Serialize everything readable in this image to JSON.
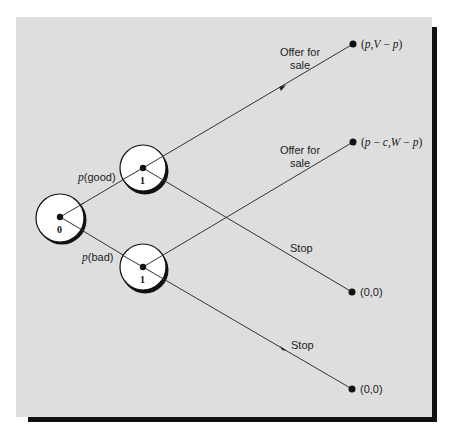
{
  "diagram": {
    "type": "game-tree",
    "nodes": [
      {
        "id": "n0",
        "label": "0",
        "player": "0"
      },
      {
        "id": "n1_good",
        "label": "1",
        "player": "1"
      },
      {
        "id": "n1_bad",
        "label": "1",
        "player": "1"
      }
    ],
    "edges": [
      {
        "from": "n0",
        "to": "n1_good",
        "label": "p(good)"
      },
      {
        "from": "n0",
        "to": "n1_bad",
        "label": "p(bad)"
      },
      {
        "from": "n1_good",
        "to": "t1",
        "label": "Offer for sale"
      },
      {
        "from": "n1_good",
        "to": "t3",
        "label": "Stop"
      },
      {
        "from": "n1_bad",
        "to": "t2",
        "label": "Offer for sale"
      },
      {
        "from": "n1_bad",
        "to": "t4",
        "label": "Stop"
      }
    ],
    "terminals": [
      {
        "id": "t1",
        "payoff": "(p,V − p)"
      },
      {
        "id": "t2",
        "payoff": "(p − c,W − p)"
      },
      {
        "id": "t3",
        "payoff": "(0,0)"
      },
      {
        "id": "t4",
        "payoff": "(0,0)"
      }
    ]
  },
  "labels": {
    "node0": "0",
    "node1_good": "1",
    "node1_bad": "1",
    "p_good_prefix": "p",
    "p_good_suffix": "(good)",
    "p_bad_prefix": "p",
    "p_bad_suffix": "(bad)",
    "offer_top_line1": "Offer for",
    "offer_top_line2": "sale",
    "offer_mid_line1": "Offer for",
    "offer_mid_line2": "sale",
    "stop_upper": "Stop",
    "stop_lower": "Stop",
    "payoff1_open": "(",
    "payoff1_p": "p",
    "payoff1_mid": ",",
    "payoff1_V": "V",
    "payoff1_minus": " − ",
    "payoff1_p2": "p",
    "payoff1_close": ")",
    "payoff2_open": "(",
    "payoff2_p": "p",
    "payoff2_minus1": " − ",
    "payoff2_c": "c",
    "payoff2_comma": ",",
    "payoff2_W": "W",
    "payoff2_minus2": " − ",
    "payoff2_p2": "p",
    "payoff2_close": ")",
    "payoff3": "(0,0)",
    "payoff4": "(0,0)"
  },
  "colors": {
    "panel": "#dedede",
    "shadow": "#111111",
    "line": "#333333",
    "node_fill": "#ffffff"
  }
}
